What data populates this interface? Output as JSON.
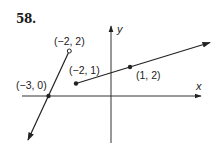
{
  "problem": {
    "number": "58."
  },
  "axes": {
    "x_label": "x",
    "y_label": "y"
  },
  "points": [
    {
      "label": "(−2, 2)",
      "x": -2,
      "y": 2,
      "style": "open"
    },
    {
      "label": "(−2, 1)",
      "x": -2,
      "y": 1,
      "style": "closed"
    },
    {
      "label": "(1, 2)",
      "x": 1,
      "y": 2,
      "style": "closed"
    },
    {
      "label": "(−3, 0)",
      "x": -3,
      "y": 0,
      "style": "closed"
    }
  ],
  "pieces": [
    {
      "name": "left-ray",
      "from": "(−2, 2) open",
      "through": "(−3, 0)",
      "direction": "down-left arrow"
    },
    {
      "name": "right-ray",
      "from": "(−2, 1) closed",
      "through": "(1, 2)",
      "direction": "up-right arrow"
    }
  ],
  "colors": {
    "ink": "#222222",
    "background": "#ffffff"
  }
}
